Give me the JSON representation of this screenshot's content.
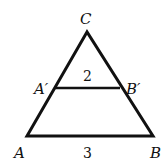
{
  "diagram": {
    "type": "similar-triangles",
    "colors": {
      "stroke": "#111111",
      "background": "#ffffff"
    },
    "vertices": {
      "C": {
        "label": "C",
        "x": 87,
        "y": 32
      },
      "A": {
        "label": "A",
        "x": 27,
        "y": 136
      },
      "B": {
        "label": "B",
        "x": 153,
        "y": 136
      },
      "A_prime": {
        "label": "A′",
        "x": 55,
        "y": 88
      },
      "B_prime": {
        "label": "B′",
        "x": 120,
        "y": 88
      }
    },
    "segments": {
      "AB": {
        "length_label": "3"
      },
      "A_prime_B_prime": {
        "length_label": "2"
      }
    }
  }
}
